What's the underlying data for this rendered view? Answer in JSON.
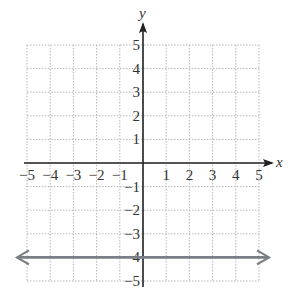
{
  "chart_data": {
    "type": "line",
    "title": "",
    "xlabel": "x",
    "ylabel": "y",
    "xlim": [
      -5,
      5
    ],
    "ylim": [
      -5,
      5
    ],
    "grid": true,
    "x_ticks": [
      "-5",
      "-4",
      "-3",
      "-2",
      "-1",
      "1",
      "2",
      "3",
      "4",
      "5"
    ],
    "y_ticks": [
      "5",
      "4",
      "3",
      "2",
      "1",
      "-1",
      "-2",
      "-3",
      "-4",
      "-5"
    ],
    "series": [
      {
        "name": "y = -4",
        "x": [
          -5,
          5
        ],
        "y": [
          -4,
          -4
        ],
        "color": "#7a7f85",
        "arrows": "both"
      }
    ],
    "legend": null
  },
  "labels": {
    "x_axis": "x",
    "y_axis": "y"
  },
  "colors": {
    "axis": "#222222",
    "grid": "#b8b8b8",
    "line": "#7a7f85"
  }
}
